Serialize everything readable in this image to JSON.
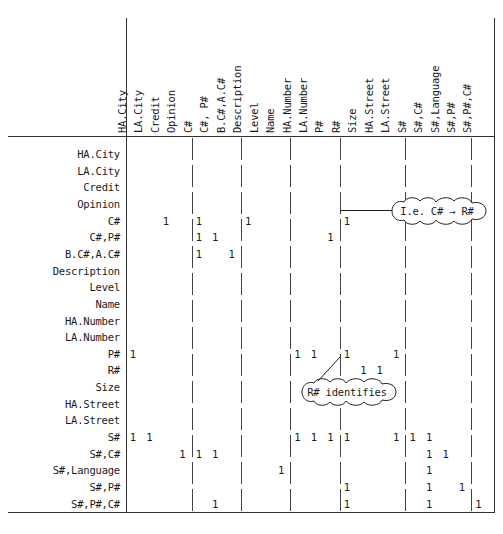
{
  "diagram": {
    "type": "dependency-matrix",
    "columns": [
      "HA.City",
      "LA.City",
      "Credit",
      "Opinion",
      "C#",
      "C#, P#",
      "B.C#,A.C#",
      "Description",
      "Level",
      "Name",
      "HA.Number",
      "LA.Number",
      "P#",
      "R#",
      "Size",
      "HA.Street",
      "LA.Street",
      "S#",
      "S#,C#",
      "S#,Language",
      "S#,P#",
      "S#,P#,C#"
    ],
    "rows": [
      "HA.City",
      "LA.City",
      "Credit",
      "Opinion",
      "C#",
      "C#,P#",
      "B.C#,A.C#",
      "Description",
      "Level",
      "Name",
      "HA.Number",
      "LA.Number",
      "P#",
      "R#",
      "Size",
      "HA.Street",
      "LA.Street",
      "S#",
      "S#,C#",
      "S#,Language",
      "S#,P#",
      "S#,P#,C#"
    ],
    "row_indent": [
      0,
      0,
      1,
      1,
      1,
      1,
      0,
      1,
      1,
      1,
      0,
      0,
      1,
      1,
      1,
      0,
      0,
      1,
      1,
      1,
      1,
      1
    ],
    "mark_symbol": "1",
    "cells": [
      {
        "row": 4,
        "col": 2
      },
      {
        "row": 4,
        "col": 4
      },
      {
        "row": 4,
        "col": 7
      },
      {
        "row": 4,
        "col": 13
      },
      {
        "row": 5,
        "col": 4
      },
      {
        "row": 5,
        "col": 5
      },
      {
        "row": 5,
        "col": 12
      },
      {
        "row": 6,
        "col": 4
      },
      {
        "row": 6,
        "col": 6
      },
      {
        "row": 12,
        "col": 0
      },
      {
        "row": 12,
        "col": 10
      },
      {
        "row": 12,
        "col": 11
      },
      {
        "row": 12,
        "col": 13
      },
      {
        "row": 12,
        "col": 16
      },
      {
        "row": 13,
        "col": 14
      },
      {
        "row": 13,
        "col": 15
      },
      {
        "row": 17,
        "col": 0
      },
      {
        "row": 17,
        "col": 1
      },
      {
        "row": 17,
        "col": 10
      },
      {
        "row": 17,
        "col": 11
      },
      {
        "row": 17,
        "col": 12
      },
      {
        "row": 17,
        "col": 13
      },
      {
        "row": 17,
        "col": 16
      },
      {
        "row": 17,
        "col": 17
      },
      {
        "row": 17,
        "col": 18
      },
      {
        "row": 18,
        "col": 3
      },
      {
        "row": 18,
        "col": 4
      },
      {
        "row": 18,
        "col": 5
      },
      {
        "row": 18,
        "col": 18
      },
      {
        "row": 18,
        "col": 19
      },
      {
        "row": 19,
        "col": 9
      },
      {
        "row": 19,
        "col": 18
      },
      {
        "row": 20,
        "col": 13
      },
      {
        "row": 20,
        "col": 18
      },
      {
        "row": 20,
        "col": 20
      },
      {
        "row": 21,
        "col": 5
      },
      {
        "row": 21,
        "col": 13
      },
      {
        "row": 21,
        "col": 18
      },
      {
        "row": 21,
        "col": 21
      }
    ],
    "group_separators_after_column": [
      3,
      6,
      9,
      12,
      16,
      20
    ],
    "annotations": [
      {
        "id": "callout-ie-cnum-rnum",
        "text": "I.e. C# → R#",
        "points_to_row": 4,
        "points_to_col": 13
      },
      {
        "id": "callout-rnum-identifies",
        "text": "R# identifies",
        "points_to_row": 13,
        "points_to_col": 14
      }
    ]
  }
}
